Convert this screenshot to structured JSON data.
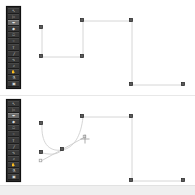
{
  "app": {
    "title": "Vector Path Editor",
    "background_color": "#ffffff",
    "divider_color": "#e8e8e8"
  },
  "status": {
    "text": "",
    "strip_color": "#efefef"
  },
  "toolbar": {
    "background_color": "#2a2a2a",
    "button_color": "#3a3a3a",
    "active_color": "#6a6a6a",
    "items": [
      {
        "name": "select-tool",
        "glyph": "↖",
        "label": "Select",
        "active": false
      },
      {
        "name": "direct-select-tool",
        "glyph": "▷",
        "label": "Direct Select",
        "active": false
      },
      {
        "name": "pen-tool",
        "glyph": "✒",
        "label": "Pen",
        "active": true
      },
      {
        "name": "node-tool",
        "glyph": "◆",
        "label": "Node",
        "active": false
      },
      {
        "name": "shape-tool",
        "glyph": "□",
        "label": "Rectangle",
        "active": false
      },
      {
        "name": "ellipse-tool",
        "glyph": "○",
        "label": "Ellipse",
        "active": false
      },
      {
        "name": "text-tool",
        "glyph": "T",
        "label": "Text",
        "active": false
      },
      {
        "name": "line-tool",
        "glyph": "╱",
        "label": "Line",
        "active": false
      },
      {
        "name": "bezier-tool",
        "glyph": "∿",
        "label": "Bezier",
        "active": false
      },
      {
        "name": "zoom-tool",
        "glyph": "⌕",
        "label": "Zoom",
        "active": false
      },
      {
        "name": "hand-tool",
        "glyph": "✋",
        "label": "Pan",
        "active": false
      },
      {
        "name": "eyedropper-tool",
        "glyph": "⚗",
        "label": "Eyedropper",
        "active": false
      },
      {
        "name": "fill-tool",
        "glyph": "▣",
        "label": "Fill",
        "active": false
      }
    ]
  },
  "panels": [
    {
      "id": "panel-top",
      "name": "canvas-before",
      "label": "Before",
      "path_kind": "polyline",
      "stroke_color": "#d6d6d6",
      "anchor_color": "#5a5a5a",
      "path_d": "M 42,28 L 42,57 L 83,57 L 83,21 L 132,21 L 132,85 L 184,85",
      "anchors": [
        {
          "name": "anchor-0",
          "x": 42,
          "y": 28,
          "selected": true
        },
        {
          "name": "anchor-1",
          "x": 42,
          "y": 57,
          "selected": true
        },
        {
          "name": "anchor-2",
          "x": 83,
          "y": 57,
          "selected": true
        },
        {
          "name": "anchor-3",
          "x": 83,
          "y": 21,
          "selected": true
        },
        {
          "name": "anchor-4",
          "x": 132,
          "y": 21,
          "selected": true
        },
        {
          "name": "anchor-5",
          "x": 132,
          "y": 85,
          "selected": true
        },
        {
          "name": "anchor-6",
          "x": 184,
          "y": 85,
          "selected": true
        }
      ],
      "handles": []
    },
    {
      "id": "panel-bottom",
      "name": "canvas-after",
      "label": "After",
      "path_kind": "bezier",
      "stroke_color": "#d6d6d6",
      "anchor_color": "#5a5a5a",
      "path_d": "M 42,28 C 41,46 48,56 62,54 C 74,52 81,40 83,21 L 132,21 L 132,85 L 184,85",
      "curve_extra_d": "M 42,57 C 48,58 56,60 62,54",
      "anchors": [
        {
          "name": "anchor-0",
          "x": 42,
          "y": 28,
          "selected": true
        },
        {
          "name": "anchor-1",
          "x": 42,
          "y": 57,
          "selected": true
        },
        {
          "name": "anchor-2",
          "x": 62,
          "y": 54,
          "selected": true
        },
        {
          "name": "anchor-3",
          "x": 83,
          "y": 21,
          "selected": true
        },
        {
          "name": "anchor-4",
          "x": 132,
          "y": 21,
          "selected": true
        },
        {
          "name": "anchor-5",
          "x": 132,
          "y": 85,
          "selected": true
        },
        {
          "name": "anchor-6",
          "x": 184,
          "y": 85,
          "selected": true
        }
      ],
      "handles": [
        {
          "name": "handle-anchor-2",
          "anchor_x": 62,
          "anchor_y": 54,
          "in_x": 41,
          "in_y": 65,
          "out_x": 85,
          "out_y": 41
        }
      ],
      "cursor": {
        "name": "crosshair-cursor",
        "x": 85,
        "y": 43
      }
    }
  ]
}
